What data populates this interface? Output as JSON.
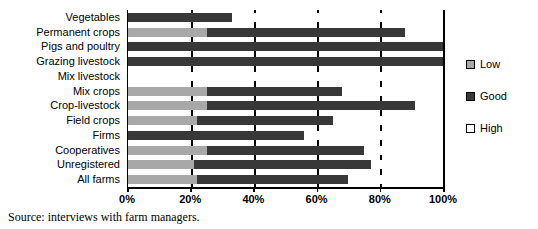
{
  "chart_data": {
    "type": "bar",
    "orientation": "horizontal",
    "stacked": true,
    "stack_total": 100,
    "title": "",
    "subtitle": "",
    "xlabel": "",
    "ylabel": "",
    "xlim": [
      0,
      100
    ],
    "xticks": [
      0,
      20,
      40,
      60,
      80,
      100
    ],
    "xticklabels": [
      "0%",
      "20%",
      "40%",
      "60%",
      "80%",
      "100%"
    ],
    "grid": true,
    "grid_axis": "x",
    "legend_position": "right",
    "categories": [
      "Vegetables",
      "Permanent crops",
      "Pigs and poultry",
      "Grazing livestock",
      "Mix livestock",
      "Mix crops",
      "Crop-livestock",
      "Field crops",
      "Firms",
      "Cooperatives",
      "Unregistered",
      "All farms"
    ],
    "series": [
      {
        "name": "Low",
        "color": "#a8a8a8",
        "values": [
          0,
          25,
          0,
          0,
          0,
          25,
          25,
          22,
          0,
          25,
          21,
          22
        ]
      },
      {
        "name": "Good",
        "color": "#383838",
        "values": [
          33,
          63,
          100,
          100,
          0,
          43,
          66,
          43,
          56,
          50,
          56,
          48
        ]
      },
      {
        "name": "High",
        "color": "#ffffff",
        "values": [
          67,
          12,
          0,
          0,
          100,
          32,
          9,
          35,
          44,
          25,
          23,
          30
        ]
      }
    ]
  },
  "legend": {
    "items": [
      {
        "label": "Low",
        "swatch": "low-swatch"
      },
      {
        "label": "Good",
        "swatch": "good-swatch"
      },
      {
        "label": "High",
        "swatch": "high-swatch"
      }
    ]
  },
  "source": {
    "text": "Source: interviews with farm managers."
  },
  "colors": {
    "low": "#a8a8a8",
    "good": "#383838",
    "high": "#ffffff",
    "axis": "#000000"
  }
}
